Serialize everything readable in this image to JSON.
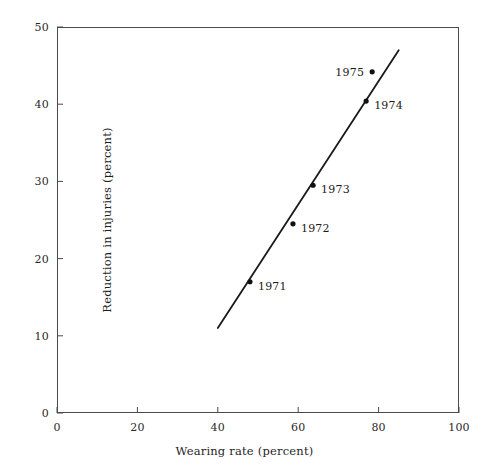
{
  "chart_data": {
    "type": "scatter",
    "title": "",
    "xlabel": "Wearing rate (percent)",
    "ylabel": "Reduction in injuries (percent)",
    "xlim": [
      0,
      100
    ],
    "ylim": [
      0,
      50
    ],
    "xticks": [
      0,
      20,
      40,
      60,
      80,
      100
    ],
    "yticks": [
      0,
      10,
      20,
      30,
      40,
      50
    ],
    "xtick_labels": [
      "0",
      "20",
      "40",
      "60",
      "80",
      "100"
    ],
    "ytick_labels": [
      "0",
      "10",
      "20",
      "30",
      "40",
      "50"
    ],
    "grid": false,
    "legend": null,
    "points": [
      {
        "label": "1971",
        "x": 48.0,
        "y": 17.0,
        "label_side": "right",
        "on_line": true
      },
      {
        "label": "1972",
        "x": 58.7,
        "y": 24.5,
        "label_side": "right",
        "on_line": true
      },
      {
        "label": "1973",
        "x": 63.7,
        "y": 29.5,
        "label_side": "right",
        "on_line": true
      },
      {
        "label": "1974",
        "x": 76.9,
        "y": 40.4,
        "label_side": "right",
        "on_line": true
      },
      {
        "label": "1975",
        "x": 78.4,
        "y": 44.2,
        "label_side": "left",
        "on_line": false
      }
    ],
    "fit_line": {
      "x0": 40.0,
      "y0": 11.0,
      "x1": 85.0,
      "y1": 47.0,
      "color": "#1a1a1a"
    },
    "style": {
      "axis_color": "#4a4a4a",
      "marker_color": "#111111",
      "background": "#ffffff",
      "tick_direction": "in"
    }
  }
}
